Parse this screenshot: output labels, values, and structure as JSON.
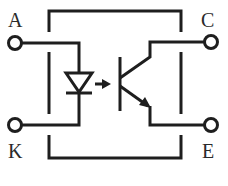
{
  "diagram": {
    "type": "optocoupler-schematic",
    "colors": {
      "stroke": "#1e1e1e",
      "background": "#ffffff",
      "label": "#2a2a2a"
    },
    "terminals": [
      {
        "id": "A",
        "label": "A",
        "role": "anode"
      },
      {
        "id": "K",
        "label": "K",
        "role": "cathode"
      },
      {
        "id": "C",
        "label": "C",
        "role": "collector"
      },
      {
        "id": "E",
        "label": "E",
        "role": "emitter"
      }
    ],
    "components": [
      {
        "name": "LED",
        "icon": "diode-icon"
      },
      {
        "name": "light-coupling arrow",
        "icon": "arrow-right-icon"
      },
      {
        "name": "NPN phototransistor",
        "icon": "transistor-npn-icon"
      }
    ]
  }
}
